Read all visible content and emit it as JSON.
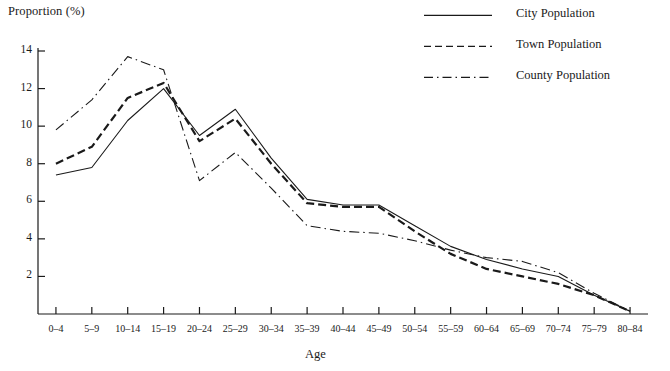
{
  "chart_data": {
    "type": "line",
    "title": "",
    "xlabel": "Age",
    "ylabel": "Proportion (%)",
    "categories": [
      "0–4",
      "5–9",
      "10–14",
      "15–19",
      "20–24",
      "25–29",
      "30–34",
      "35–39",
      "40–44",
      "45–49",
      "50–54",
      "55–59",
      "60–64",
      "65–69",
      "70–74",
      "75–79",
      "80–84"
    ],
    "ylim": [
      0,
      14
    ],
    "xlim_labels": [
      "0–4",
      "80–84"
    ],
    "yticks": [
      2,
      4,
      6,
      8,
      10,
      12,
      14
    ],
    "ytick_labels": [
      "2",
      "4",
      "6",
      "8",
      "10",
      "12",
      "14"
    ],
    "grid": false,
    "legend_position": "top-right",
    "series": [
      {
        "name": "City Population",
        "style": "solid",
        "color": "#1a1a1a",
        "values": [
          7.4,
          7.8,
          10.3,
          12.0,
          9.5,
          10.9,
          8.3,
          6.1,
          5.8,
          5.8,
          4.7,
          3.6,
          2.9,
          2.4,
          2.0,
          1.0,
          0.15
        ]
      },
      {
        "name": "Town Population",
        "style": "dashed",
        "color": "#1a1a1a",
        "values": [
          8.0,
          8.9,
          11.5,
          12.3,
          9.2,
          10.4,
          8.0,
          5.9,
          5.7,
          5.7,
          4.4,
          3.2,
          2.4,
          2.0,
          1.6,
          1.0,
          0.15
        ]
      },
      {
        "name": "County Population",
        "style": "dash-dot",
        "color": "#1a1a1a",
        "values": [
          9.8,
          11.4,
          13.7,
          13.0,
          7.1,
          8.6,
          6.7,
          4.7,
          4.4,
          4.3,
          3.9,
          3.4,
          3.0,
          2.8,
          2.2,
          1.1,
          0.15
        ]
      }
    ]
  },
  "axes": {
    "y_title": "Proportion (%)",
    "x_title": "Age"
  },
  "legend": {
    "items": [
      {
        "label": "City Population",
        "sample": "solid-line-sample"
      },
      {
        "label": "Town Population",
        "sample": "dashed-line-sample"
      },
      {
        "label": "County Population",
        "sample": "dash-dot-line-sample"
      }
    ]
  }
}
